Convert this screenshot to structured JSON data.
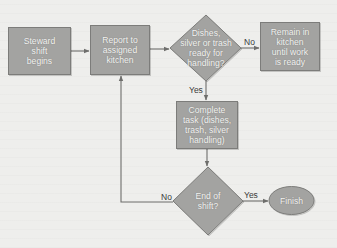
{
  "diagram": {
    "type": "flowchart",
    "colors": {
      "background": "#eeeeec",
      "shape_fill": "#a3a3a1",
      "shape_stroke": "#7c7c7a",
      "connector": "#6e6e6c",
      "label_text": "#f4f4f2",
      "edge_text": "#3a3a3a"
    },
    "nodes": [
      {
        "id": "start",
        "shape": "rectangle",
        "label": "Steward\nshift\nbegins"
      },
      {
        "id": "report",
        "shape": "rectangle",
        "label": "Report to\nassigned\nkitchen"
      },
      {
        "id": "ready_decision",
        "shape": "diamond",
        "label": "Dishes,\nsilver or trash\nready for\nhandling?"
      },
      {
        "id": "remain",
        "shape": "rectangle",
        "label": "Remain in\nkitchen\nuntil work\nis ready"
      },
      {
        "id": "complete",
        "shape": "rectangle",
        "label": "Complete\ntask (dishes,\ntrash, silver\nhandling)"
      },
      {
        "id": "end_decision",
        "shape": "diamond",
        "label": "End of\nshift?"
      },
      {
        "id": "finish",
        "shape": "ellipse",
        "label": "Finish"
      }
    ],
    "edges": [
      {
        "from": "start",
        "to": "report",
        "label": ""
      },
      {
        "from": "report",
        "to": "ready_decision",
        "label": ""
      },
      {
        "from": "ready_decision",
        "to": "remain",
        "label": "No"
      },
      {
        "from": "ready_decision",
        "to": "complete",
        "label": "Yes"
      },
      {
        "from": "complete",
        "to": "end_decision",
        "label": ""
      },
      {
        "from": "end_decision",
        "to": "finish",
        "label": "Yes"
      },
      {
        "from": "end_decision",
        "to": "report",
        "label": "No"
      }
    ]
  }
}
